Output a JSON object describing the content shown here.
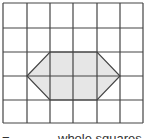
{
  "diagram": {
    "grid": {
      "cols": 6,
      "rows": 5,
      "x_lines": [
        3,
        27,
        50,
        73,
        97,
        120,
        143
      ],
      "y_lines": [
        3,
        28,
        52,
        76,
        100,
        123
      ],
      "line_color": "#444444"
    },
    "shape": {
      "type": "hexagon",
      "points": [
        [
          27,
          76
        ],
        [
          50,
          52
        ],
        [
          97,
          52
        ],
        [
          120,
          76
        ],
        [
          97,
          100
        ],
        [
          50,
          100
        ]
      ],
      "fill": "#e6e6e6",
      "stroke": "#444444"
    }
  },
  "caption": {
    "equals": "=",
    "text": "whole squares"
  }
}
